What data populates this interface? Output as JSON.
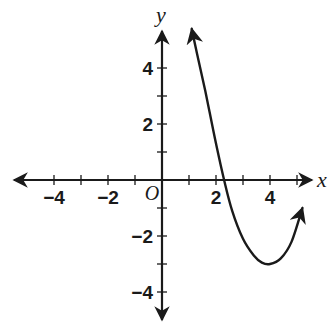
{
  "chart_data": {
    "type": "line",
    "title": "",
    "xlabel": "x",
    "ylabel": "y",
    "origin_label": "O",
    "xlim": [
      -5.5,
      5.5
    ],
    "ylim": [
      -5,
      5.5
    ],
    "grid": false,
    "x_ticks": [
      -4,
      -3,
      -2,
      -1,
      1,
      2,
      3,
      4,
      5
    ],
    "y_ticks": [
      -4,
      -3,
      -2,
      -1,
      1,
      2,
      3,
      4
    ],
    "x_tick_labels": [
      {
        "value": -4,
        "text": "−4"
      },
      {
        "value": -2,
        "text": "−2"
      },
      {
        "value": 2,
        "text": "2"
      },
      {
        "value": 4,
        "text": "4"
      }
    ],
    "y_tick_labels": [
      {
        "value": 4,
        "text": "4"
      },
      {
        "value": 2,
        "text": "2"
      },
      {
        "value": -2,
        "text": "−2"
      },
      {
        "value": -4,
        "text": "−4"
      }
    ],
    "series": [
      {
        "name": "curve",
        "description": "cubic-like curve with arrows at both ends, decreasing through x-intercept near 2.3 to a local minimum at (4, -3) then rising",
        "x": [
          1.1,
          1.3,
          1.6,
          2.0,
          2.3,
          2.6,
          3.0,
          3.4,
          3.7,
          4.0,
          4.4,
          4.8,
          5.2
        ],
        "y": [
          5.4,
          4.5,
          3.2,
          1.3,
          0.0,
          -1.1,
          -2.1,
          -2.7,
          -2.95,
          -3.0,
          -2.8,
          -2.2,
          -1.0
        ],
        "start_arrow": true,
        "end_arrow": true
      }
    ],
    "key_points": {
      "x_intercept": 2.3,
      "local_minimum": [
        4,
        -3
      ]
    }
  }
}
